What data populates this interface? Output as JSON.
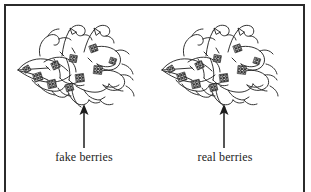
{
  "figure": {
    "background_color": "#ffffff",
    "frame_color": "#2b2b2b",
    "ink_color": "#1d1d1d",
    "panels": [
      {
        "id": "left",
        "illustration_name": "berry-cluster-drawing",
        "arrow_direction": "up",
        "caption": "fake berries"
      },
      {
        "id": "right",
        "illustration_name": "berry-cluster-drawing",
        "arrow_direction": "up",
        "caption": "real berries"
      }
    ]
  }
}
